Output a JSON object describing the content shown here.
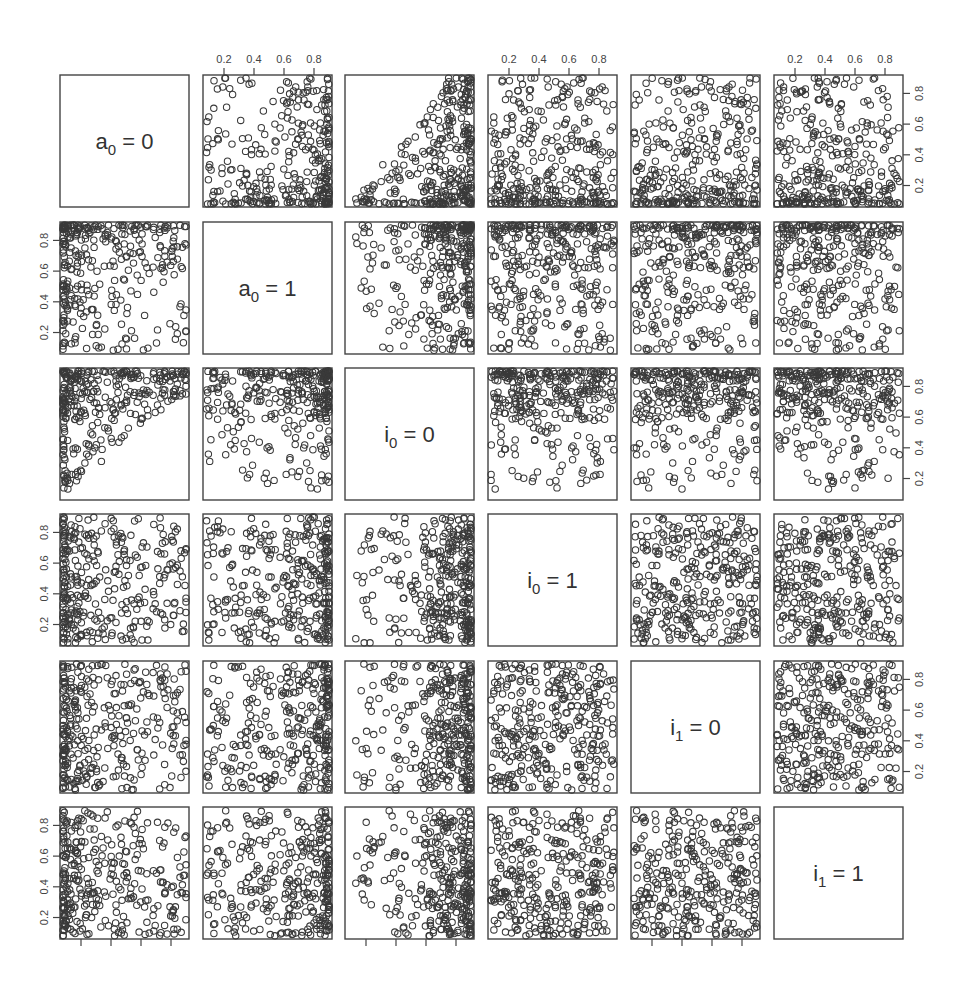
{
  "chart_data": {
    "type": "scatter",
    "subtype": "scatterplot-matrix",
    "title": "",
    "variables": [
      {
        "id": "a0_0",
        "base": "a",
        "sub": "0",
        "eq": "= 0",
        "label": "a0 = 0"
      },
      {
        "id": "a0_1",
        "base": "a",
        "sub": "0",
        "eq": "= 1",
        "label": "a0 = 1"
      },
      {
        "id": "i0_0",
        "base": "i",
        "sub": "0",
        "eq": "= 0",
        "label": "i0 = 0"
      },
      {
        "id": "i0_1",
        "base": "i",
        "sub": "0",
        "eq": "= 1",
        "label": "i0 = 1"
      },
      {
        "id": "i1_0",
        "base": "i",
        "sub": "1",
        "eq": "= 0",
        "label": "i1 = 0"
      },
      {
        "id": "i1_1",
        "base": "i",
        "sub": "1",
        "eq": "= 1",
        "label": "i1 = 1"
      }
    ],
    "axis_range": [
      0.06,
      0.92
    ],
    "tick_values": [
      0.2,
      0.4,
      0.6,
      0.8
    ],
    "tick_labels": [
      "0.2",
      "0.4",
      "0.6",
      "0.8"
    ],
    "top_axis_labeled_columns": [
      1,
      3,
      5
    ],
    "bottom_axis_ticks_columns": [
      0,
      2,
      4
    ],
    "left_axis_labeled_rows": [
      1,
      3,
      5
    ],
    "right_axis_labeled_rows": [
      0,
      2,
      4
    ],
    "grid": false,
    "legend": null,
    "n_points_per_panel": 320,
    "marker": "open-circle",
    "variable_distributions": {
      "a0_0": "right-skewed, concentrated 0.1-0.35, tail to 0.85",
      "a0_1": "left-skewed, concentrated 0.6-0.9",
      "i0_0": "left-skewed, concentrated 0.7-0.9; lower bound rises with a0_0 (triangular pattern)",
      "i0_1": "roughly uniform 0.1-0.9, mild low-skew",
      "i1_0": "roughly uniform 0.1-0.9",
      "i1_1": "roughly uniform 0.1-0.9"
    },
    "generator": {
      "seed": 1337,
      "n": 320
    }
  },
  "colors": {
    "background": "#ffffff",
    "frame": "#444444",
    "marker": "#3a3a3a",
    "text": "#333333"
  },
  "layout": {
    "col_left": [
      60,
      203,
      345,
      488,
      631,
      774
    ],
    "row_top": [
      75,
      222,
      368,
      514,
      661,
      807
    ],
    "panel_w": 129,
    "panel_h": 132
  }
}
